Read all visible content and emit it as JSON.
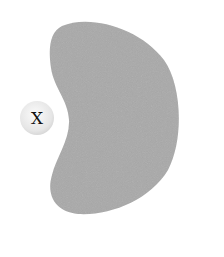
{
  "diagram": {
    "shape": {
      "kind": "kidney-bean blob",
      "fill": "#a9a9a9"
    },
    "marker": {
      "label": "X",
      "fill": "#eeeeee",
      "text_color": "#111111"
    }
  }
}
